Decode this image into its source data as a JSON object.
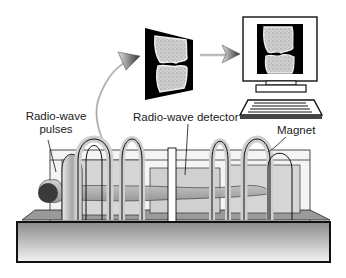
{
  "diagram": {
    "labels": {
      "pulses_line1": "Radio-wave",
      "pulses_line2": "pulses",
      "detector": "Radio-wave detector",
      "magnet": "Magnet"
    },
    "elements": [
      {
        "id": "mri-image",
        "description": "knee joint MR image (floating, perspective)"
      },
      {
        "id": "curved-arrow",
        "description": "signal path from detector to image"
      },
      {
        "id": "straight-arrow",
        "description": "image sent to computer"
      },
      {
        "id": "computer",
        "description": "monitor displaying knee image with keyboard"
      },
      {
        "id": "scanner",
        "description": "patient lying inside ring magnets on platform"
      }
    ],
    "colors": {
      "ink": "#1a1a1a",
      "screen_bg": "#000000",
      "bone": "#c8c8c8",
      "platform_top": "#8a8a8a",
      "platform_bottom": "#f2f2f2"
    }
  }
}
